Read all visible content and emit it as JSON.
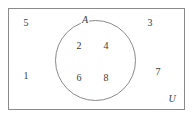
{
  "diagram": {
    "type": "venn-set-diagram",
    "width": 193,
    "height": 119,
    "stroke_color": "#8a8a8a",
    "text_color": "#3a3a3a",
    "background_color": "#ffffff",
    "universe": {
      "label": "U",
      "label_x": 172,
      "label_y": 99,
      "rect": {
        "x": 8,
        "y": 8,
        "width": 177,
        "height": 102
      }
    },
    "sets": [
      {
        "label": "A",
        "label_x": 85,
        "label_y": 20,
        "circle": {
          "cx": 95.5,
          "cy": 60.5,
          "r": 40.5
        }
      }
    ],
    "elements_inside_A": [
      {
        "value": "2",
        "x": 79,
        "y": 46
      },
      {
        "value": "4",
        "x": 106,
        "y": 46
      },
      {
        "value": "6",
        "x": 79,
        "y": 78
      },
      {
        "value": "8",
        "x": 106,
        "y": 78
      }
    ],
    "elements_outside_A": [
      {
        "value": "5",
        "x": 26,
        "y": 23
      },
      {
        "value": "3",
        "x": 150,
        "y": 23
      },
      {
        "value": "1",
        "x": 26,
        "y": 76
      },
      {
        "value": "7",
        "x": 158,
        "y": 72
      }
    ]
  }
}
